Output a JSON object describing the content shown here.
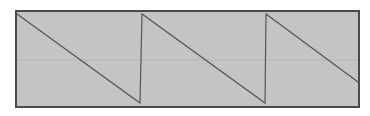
{
  "chart_data": {
    "type": "line",
    "title": "",
    "xlabel": "",
    "ylabel": "",
    "grid": {
      "horizontal_midline": true
    },
    "xlim": [
      0,
      1
    ],
    "ylim": [
      -1,
      1
    ],
    "x": [
      0.0,
      0.365,
      0.37,
      0.725,
      0.73,
      1.0
    ],
    "y": [
      1.0,
      -1.0,
      1.0,
      -1.0,
      1.0,
      -0.5
    ],
    "period_fraction": 0.36,
    "cycles_visible": 2.75
  },
  "style": {
    "background": "#c4c4c4",
    "border": "#4a4a4a",
    "trace": "#555555",
    "gridline": "#b6b6b6"
  },
  "pixels": {
    "frame": {
      "x": 15,
      "y": 10,
      "w": 345,
      "h": 98
    },
    "points": [
      [
        17,
        14
      ],
      [
        140,
        103
      ],
      [
        142,
        14
      ],
      [
        265,
        103
      ],
      [
        266,
        14
      ],
      [
        358,
        82
      ]
    ],
    "midline_y": 60
  }
}
